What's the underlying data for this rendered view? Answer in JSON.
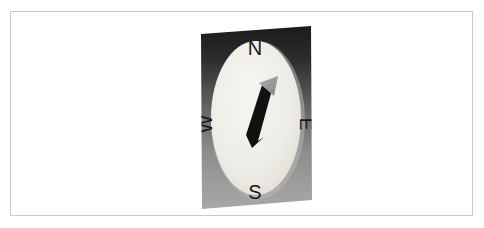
{
  "page": {
    "background_color": "#ffffff",
    "frame_border_color": "#c9c9c9"
  },
  "figure": {
    "caption": "",
    "image_alt": "compass-photograph",
    "panel": {
      "description": "square panel shown in perspective, dark gray gradient",
      "gradient_top_color": "#1d1d1f",
      "gradient_bottom_color": "#a8a8a8"
    },
    "compass": {
      "dial_face_color": "#efeee9",
      "dial_shadow_color": "#cfcdc6",
      "needle_shaft_color": "#111111",
      "needle_head_color": "#9a9a9a",
      "needle_direction": "northeast",
      "labels": {
        "north": "N",
        "east": "E",
        "south": "S",
        "west": "W"
      }
    }
  }
}
